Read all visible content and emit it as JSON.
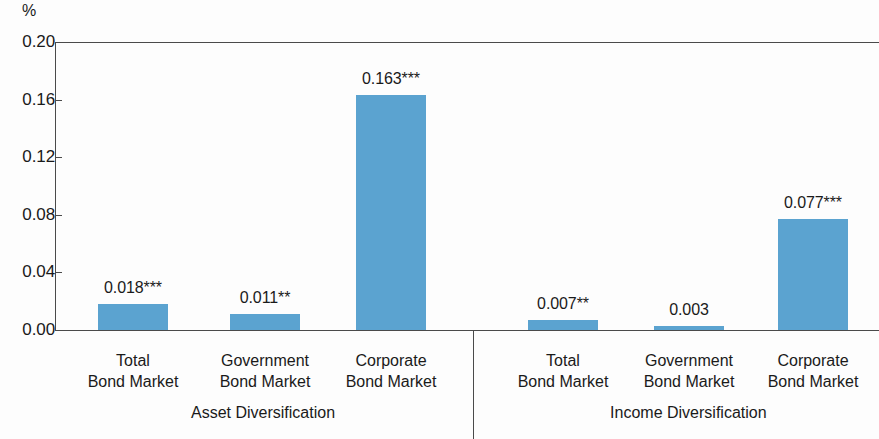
{
  "chart_data": {
    "type": "bar",
    "title": "",
    "subtitle": "",
    "xlabel": "",
    "ylabel": "%",
    "ylim": [
      0.0,
      0.2
    ],
    "ytick_labels": [
      "0.20",
      "0.16",
      "0.12",
      "0.08",
      "0.04",
      "0.00"
    ],
    "ytick_values": [
      0.2,
      0.16,
      0.12,
      0.08,
      0.04,
      0.0
    ],
    "grid": false,
    "legend": "none",
    "categories": [
      "Total Bond Market",
      "Government Bond Market",
      "Corporate Bond Market",
      "Total Bond Market",
      "Government Bond Market",
      "Corporate Bond Market"
    ],
    "values": [
      0.018,
      0.011,
      0.163,
      0.007,
      0.003,
      0.077
    ],
    "value_labels": [
      "0.018***",
      "0.011**",
      "0.163***",
      "0.007**",
      "0.003",
      "0.077***"
    ],
    "groups": [
      {
        "label": "Asset Diversification",
        "bars": [
          {
            "category_line1": "Total",
            "category_line2": "Bond Market",
            "value": 0.018,
            "value_label": "0.018***",
            "significance": "***"
          },
          {
            "category_line1": "Government",
            "category_line2": "Bond Market",
            "value": 0.011,
            "value_label": "0.011**",
            "significance": "**"
          },
          {
            "category_line1": "Corporate",
            "category_line2": "Bond Market",
            "value": 0.163,
            "value_label": "0.163***",
            "significance": "***"
          }
        ]
      },
      {
        "label": "Income Diversification",
        "bars": [
          {
            "category_line1": "Total",
            "category_line2": "Bond Market",
            "value": 0.007,
            "value_label": "0.007**",
            "significance": "**"
          },
          {
            "category_line1": "Government",
            "category_line2": "Bond Market",
            "value": 0.003,
            "value_label": "0.003",
            "significance": ""
          },
          {
            "category_line1": "Corporate",
            "category_line2": "Bond Market",
            "value": 0.077,
            "value_label": "0.077***",
            "significance": "***"
          }
        ]
      }
    ],
    "colors": {
      "bar": "#5ba3d0",
      "axis": "#4a4a4a",
      "text": "#1a1a1a",
      "background": "#fdfdfd"
    }
  },
  "axis": {
    "unit_label": "%"
  },
  "ticks": [
    {
      "label": "0.20"
    },
    {
      "label": "0.16"
    },
    {
      "label": "0.12"
    },
    {
      "label": "0.08"
    },
    {
      "label": "0.04"
    },
    {
      "label": "0.00"
    }
  ]
}
